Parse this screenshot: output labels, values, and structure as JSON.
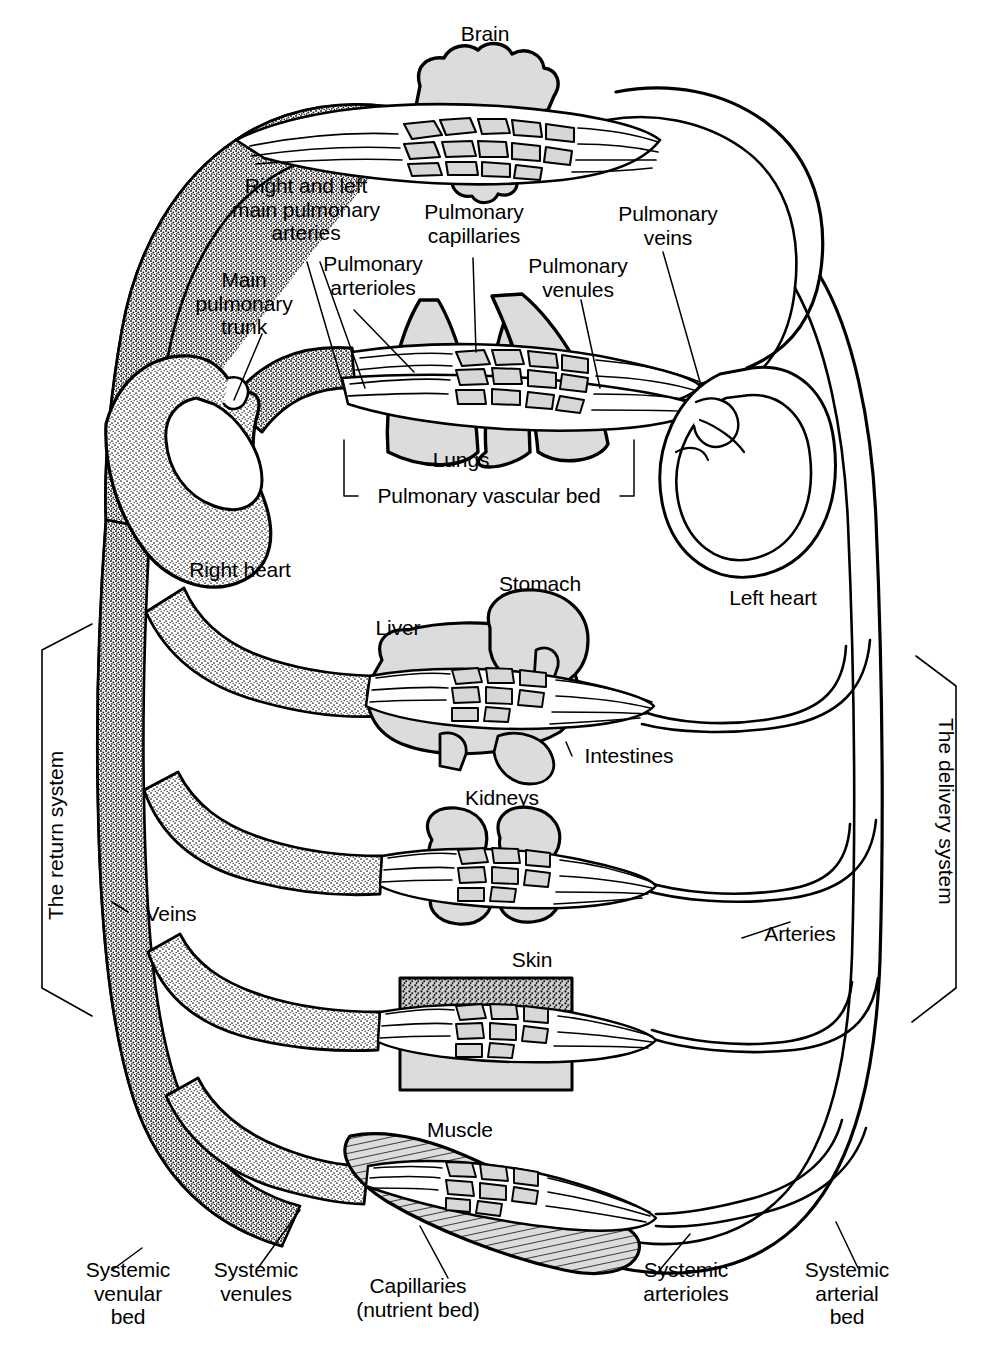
{
  "diagram": {
    "background_color": "#ffffff",
    "ink_color": "#000000",
    "organ_fill": "#d9d9d9",
    "vein_fill": "#ffffff"
  },
  "system_labels": {
    "return": "The return system",
    "delivery": "The delivery system"
  },
  "organs": {
    "brain": "Brain",
    "lungs": "Lungs",
    "liver": "Liver",
    "stomach": "Stomach",
    "intestines": "Intestines",
    "kidneys": "Kidneys",
    "skin": "Skin",
    "muscle": "Muscle"
  },
  "heart": {
    "right": "Right heart",
    "left": "Left heart"
  },
  "pulmonary_labels": {
    "main_trunk": "Main\npulmonary\ntrunk",
    "main_arteries": "Right and left\nmain pulmonary\narteries",
    "arterioles": "Pulmonary\narterioles",
    "capillaries": "Pulmonary\ncapillaries",
    "venules": "Pulmonary\nvenules",
    "veins": "Pulmonary\nveins",
    "vascular_bed": "Pulmonary vascular bed"
  },
  "systemic_labels": {
    "veins": "Veins",
    "arteries": "Arteries",
    "venular_bed": "Systemic\nvenular\nbed",
    "venules": "Systemic\nvenules",
    "capillaries": "Capillaries\n(nutrient bed)",
    "arterioles": "Systemic\narterioles",
    "arterial_bed": "Systemic\narterial\nbed"
  }
}
